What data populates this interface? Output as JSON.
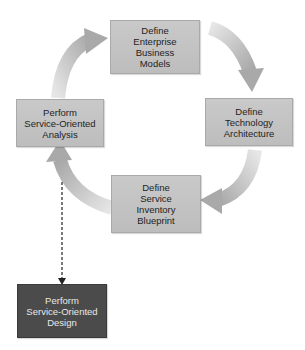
{
  "diagram": {
    "type": "cycle",
    "nodes": [
      {
        "id": "enterprise",
        "label": "Define\nEnterprise\nBusiness\nModels",
        "style": "light"
      },
      {
        "id": "technology",
        "label": "Define\nTechnology\nArchitecture",
        "style": "light"
      },
      {
        "id": "inventory",
        "label": "Define\nService\nInventory\nBlueprint",
        "style": "light"
      },
      {
        "id": "analysis",
        "label": "Perform\nService-Oriented\nAnalysis",
        "style": "light"
      },
      {
        "id": "design",
        "label": "Perform\nService-Oriented\nDesign",
        "style": "dark"
      }
    ],
    "edges": [
      {
        "from": "enterprise",
        "to": "technology",
        "style": "curved-arrow"
      },
      {
        "from": "technology",
        "to": "inventory",
        "style": "curved-arrow"
      },
      {
        "from": "inventory",
        "to": "analysis",
        "style": "curved-arrow"
      },
      {
        "from": "analysis",
        "to": "enterprise",
        "style": "curved-arrow"
      },
      {
        "from": "analysis",
        "to": "design",
        "style": "dashed-arrow"
      }
    ],
    "colors": {
      "light_box": "#c4c4c4",
      "dark_box": "#4b4b4b",
      "arrow": "#b5b5b5",
      "dashed_arrow": "#222222"
    }
  }
}
